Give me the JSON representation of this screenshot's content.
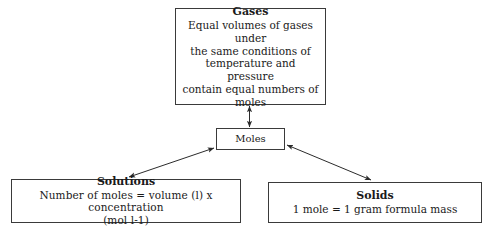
{
  "diagram": {
    "title_text": "Moles concept map",
    "background_color": "#ffffff",
    "line_color": "#3a3a3a",
    "text_color": "#1a1a1a",
    "nodes": {
      "gases": {
        "title": "Gases",
        "body": "Equal volumes of gases under\nthe same conditions of\ntemperature and pressure\ncontain equal numbers of\nmoles"
      },
      "moles": {
        "label": "Moles"
      },
      "solutions": {
        "title": "Solutions",
        "body": "Number of moles = volume (l)   x   concentration\n(mol l-1)"
      },
      "solids": {
        "title": "Solids",
        "body": "1 mole = 1 gram formula mass"
      }
    },
    "edges": [
      {
        "name": "gases-moles",
        "from": "gases",
        "to": "moles",
        "arrowheads": "both"
      },
      {
        "name": "moles-solutions",
        "from": "moles",
        "to": "solutions",
        "arrowheads": "both"
      },
      {
        "name": "moles-solids",
        "from": "moles",
        "to": "solids",
        "arrowheads": "both"
      }
    ]
  }
}
